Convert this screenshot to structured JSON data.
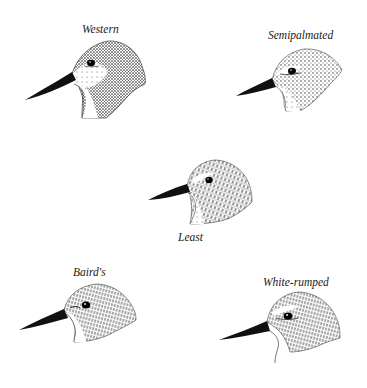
{
  "plate": {
    "subject": "Sandpiper head comparison",
    "colors": {
      "ink": "#111111",
      "background": "#ffffff"
    },
    "birds": [
      {
        "id": "western",
        "label": "Western"
      },
      {
        "id": "semipalmated",
        "label": "Semipalmated"
      },
      {
        "id": "least",
        "label": "Least"
      },
      {
        "id": "bairds",
        "label": "Baird's"
      },
      {
        "id": "white_rumped",
        "label": "White-rumped"
      }
    ]
  }
}
